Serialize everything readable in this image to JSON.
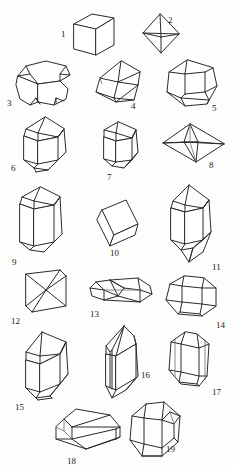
{
  "plate": {
    "title": "Crystal Forms Plate",
    "description": "Line-drawn plate of nineteen numbered crystal habit forms",
    "background_color": "#fdfdfc",
    "line_color": "#2a2a2a",
    "label_color": "#1c1c1c",
    "width": 234,
    "height": 467
  },
  "figures": [
    {
      "number": "1",
      "name": "cube",
      "label_x": 61,
      "label_y": 30
    },
    {
      "number": "2",
      "name": "octahedron",
      "label_x": 168,
      "label_y": 16
    },
    {
      "number": "3",
      "name": "truncated-cube",
      "label_x": 7,
      "label_y": 99
    },
    {
      "number": "4",
      "name": "rhombic-dodecahedron",
      "label_x": 131,
      "label_y": 102
    },
    {
      "number": "5",
      "name": "pentagonal-dodecahedron",
      "label_x": 212,
      "label_y": 104
    },
    {
      "number": "6",
      "name": "hexagonal-prism-pyramid",
      "label_x": 11,
      "label_y": 164
    },
    {
      "number": "7",
      "name": "short-hexagonal-prism",
      "label_x": 107,
      "label_y": 173
    },
    {
      "number": "8",
      "name": "flattened-bipyramid",
      "label_x": 209,
      "label_y": 161
    },
    {
      "number": "9",
      "name": "long-hexagonal-prism",
      "label_x": 12,
      "label_y": 258
    },
    {
      "number": "10",
      "name": "rhombohedron",
      "label_x": 110,
      "label_y": 249
    },
    {
      "number": "11",
      "name": "doubly-terminated-quartz-prism",
      "label_x": 212,
      "label_y": 263
    },
    {
      "number": "12",
      "name": "triangular-prism",
      "label_x": 11,
      "label_y": 317
    },
    {
      "number": "13",
      "name": "elongated-bladed-crystal",
      "label_x": 90,
      "label_y": 310
    },
    {
      "number": "14",
      "name": "tabular-hexagonal-form",
      "label_x": 216,
      "label_y": 321
    },
    {
      "number": "15",
      "name": "monoclinic-prism",
      "label_x": 15,
      "label_y": 403
    },
    {
      "number": "16",
      "name": "twinned-prism-pair",
      "label_x": 141,
      "label_y": 371
    },
    {
      "number": "17",
      "name": "flattened-tabular-prism",
      "label_x": 212,
      "label_y": 388
    },
    {
      "number": "18",
      "name": "orthorhombic-brick",
      "label_x": 67,
      "label_y": 457
    },
    {
      "number": "19",
      "name": "beveled-prism",
      "label_x": 166,
      "label_y": 445
    }
  ]
}
